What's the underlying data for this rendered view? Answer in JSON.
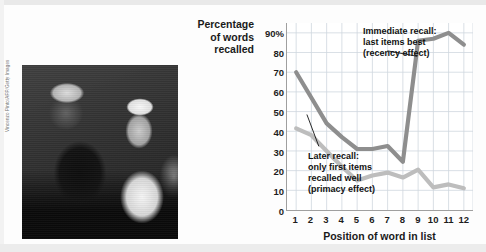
{
  "figure": {
    "y_axis_title": "Percentage\nof words\nrecalled",
    "x_axis_title": "Position of word in list",
    "photo_credit": "Vincenzo Pinto/AFP/Getty Images",
    "photo_alt": "pope-crowd-photo"
  },
  "annotations": {
    "immediate": "Immediate recall:\nlast items best\n(recency effect)",
    "later": "Later recall:\nonly first items\nrecalled well\n(primacy effect)"
  },
  "colors": {
    "immediate_line": "#8e8e8e",
    "later_line": "#bdbdbd",
    "grid": "#cfd6de",
    "axis": "#9f9f9f",
    "text": "#1a1a1a"
  },
  "chart_data": {
    "type": "line",
    "title": "",
    "xlabel": "Position of word in list",
    "ylabel": "Percentage of words recalled",
    "x": [
      1,
      2,
      3,
      4,
      5,
      6,
      7,
      8,
      9,
      10,
      11,
      12
    ],
    "categories": [
      "1",
      "2",
      "3",
      "4",
      "5",
      "6",
      "7",
      "8",
      "9",
      "10",
      "11",
      "12"
    ],
    "xtick_labels": [
      "1",
      "2",
      "3",
      "4",
      "5",
      "6",
      "7",
      "8",
      "9",
      "10",
      "11",
      "12"
    ],
    "ytick_labels": [
      "0",
      "10",
      "20",
      "30",
      "40",
      "50",
      "60",
      "70",
      "80",
      "90%"
    ],
    "ytick_values": [
      0,
      10,
      20,
      30,
      40,
      50,
      60,
      70,
      80,
      90
    ],
    "ylim": [
      0,
      95
    ],
    "xlim": [
      0.4,
      12.6
    ],
    "grid": true,
    "legend": "none",
    "series": [
      {
        "name": "Immediate recall",
        "color": "#8e8e8e",
        "values": [
          70,
          57,
          44,
          37,
          31,
          31,
          32.5,
          24.5,
          86,
          87,
          90,
          84
        ]
      },
      {
        "name": "Later recall",
        "color": "#bdbdbd",
        "values": [
          41.5,
          38,
          30,
          22,
          15,
          17.5,
          19,
          16.5,
          20.5,
          11.5,
          13,
          11
        ]
      }
    ],
    "annotations": [
      {
        "text": "Immediate recall:\nlast items best\n(recency effect)",
        "series": "Immediate recall",
        "points_to_x": 9
      },
      {
        "text": "Later recall:\nonly first items\nrecalled well\n(primacy effect)",
        "series": "Later recall",
        "points_to_x": 2
      }
    ]
  }
}
